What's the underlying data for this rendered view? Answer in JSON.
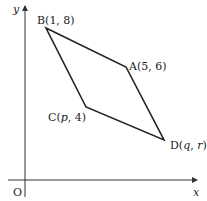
{
  "axes": {
    "x_label": "x",
    "y_label": "y",
    "origin_label": "O"
  },
  "points": {
    "A": {
      "label": "A(5, 6)",
      "name": "A",
      "coords": "(5, 6)"
    },
    "B": {
      "label": "B(1, 8)",
      "name": "B",
      "coords": "(1, 8)"
    },
    "C": {
      "label_pre": "C(",
      "var": "p",
      "label_post": ", 4)"
    },
    "D": {
      "label_pre": "D(",
      "var1": "q",
      "sep": ", ",
      "var2": "r",
      "label_post": ")"
    }
  },
  "shape": "parallelogram ABCD",
  "colors": {
    "line": "#222222",
    "axis": "#333333"
  }
}
